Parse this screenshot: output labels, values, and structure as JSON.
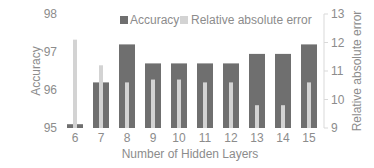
{
  "chart_data": {
    "type": "bar",
    "title": "",
    "xlabel": "Number of Hidden Layers",
    "ylabel": "Accuracy",
    "y2label": "Relative absolute error",
    "categories": [
      "6",
      "7",
      "8",
      "9",
      "10",
      "11",
      "12",
      "13",
      "14",
      "15"
    ],
    "series": [
      {
        "name": "Accuracy",
        "axis": "left",
        "color": "#6f6f6f",
        "values": [
          95.1,
          96.2,
          97.2,
          96.7,
          96.7,
          96.7,
          96.7,
          96.95,
          96.95,
          97.2
        ]
      },
      {
        "name": "Relative absolute error",
        "axis": "right",
        "color": "#d3d3d3",
        "values": [
          12.1,
          11.2,
          10.6,
          10.7,
          10.7,
          10.6,
          10.6,
          9.8,
          9.8,
          10.6
        ]
      }
    ],
    "ylim": [
      95,
      98
    ],
    "y2lim": [
      9,
      13
    ],
    "yticks": [
      "95",
      "96",
      "97",
      "98"
    ],
    "y2ticks": [
      "9",
      "10",
      "11",
      "12",
      "13"
    ],
    "legend_position": "top",
    "grid": false
  },
  "legend": {
    "items": [
      {
        "label": "Accuracy",
        "color": "#6f6f6f"
      },
      {
        "label": "Relative absolute error",
        "color": "#d3d3d3"
      }
    ]
  },
  "axes": {
    "xlabel": "Number of Hidden Layers",
    "ylabel": "Accuracy",
    "y2label": "Relative absolute error"
  }
}
